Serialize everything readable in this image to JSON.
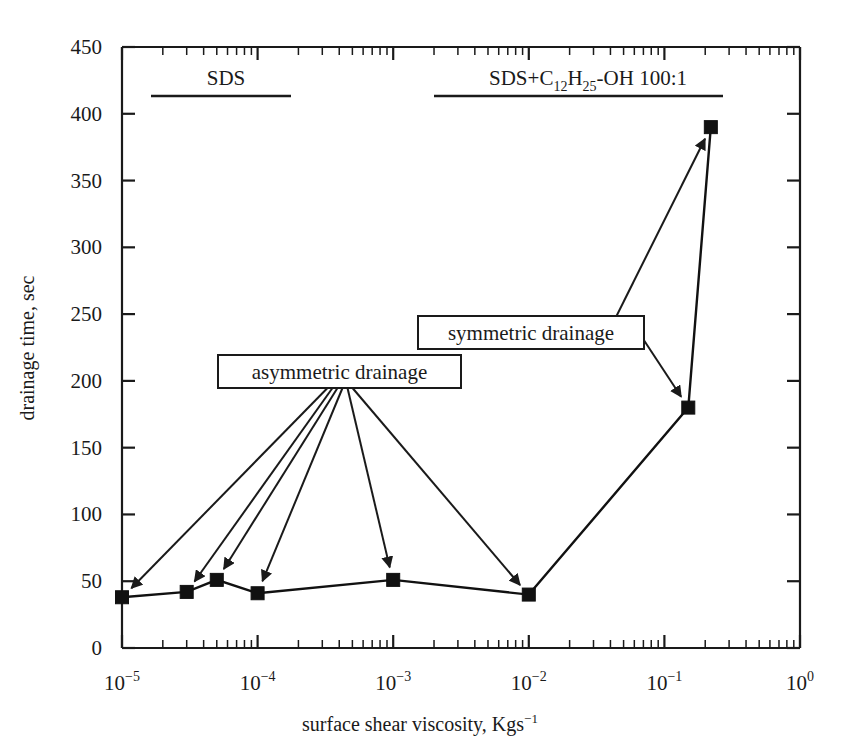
{
  "chart_data": {
    "type": "line",
    "title": "",
    "xlabel": "surface shear viscosity, Kgs−1",
    "xlabel_base": "surface shear viscosity, Kgs",
    "xlabel_exp": "−1",
    "ylabel": "drainage time, sec",
    "xscale": "log",
    "yscale": "linear",
    "xlim": [
      1e-05,
      1
    ],
    "ylim": [
      0,
      450
    ],
    "grid": false,
    "legend_position": "none",
    "x_tick_labels": [
      "10−5",
      "10−4",
      "10−3",
      "10−2",
      "10−1",
      "10⁰"
    ],
    "x_tick_values": [
      1e-05,
      0.0001,
      0.001,
      0.01,
      0.1,
      1
    ],
    "x_tick_mantissa": "10",
    "x_tick_exponents": [
      "-5",
      "-4",
      "-3",
      "-2",
      "-1",
      "0"
    ],
    "y_tick_labels": [
      "0",
      "50",
      "100",
      "150",
      "200",
      "250",
      "300",
      "350",
      "400",
      "450"
    ],
    "y_tick_values": [
      0,
      50,
      100,
      150,
      200,
      250,
      300,
      350,
      400,
      450
    ],
    "series": [
      {
        "name": "drainage time",
        "marker": "filled-square",
        "x": [
          1e-05,
          3e-05,
          5e-05,
          0.0001,
          0.001,
          0.01,
          0.15,
          0.22
        ],
        "y": [
          38,
          42,
          51,
          41,
          51,
          40,
          180,
          390
        ],
        "values": [
          38,
          42,
          51,
          41,
          51,
          40,
          180,
          390
        ]
      }
    ],
    "annotations": [
      {
        "id": "asymmetric",
        "label": "asymmetric drainage",
        "points_to": [
          {
            "x": 1e-05,
            "y": 38
          },
          {
            "x": 3e-05,
            "y": 42
          },
          {
            "x": 5e-05,
            "y": 51
          },
          {
            "x": 0.0001,
            "y": 41
          },
          {
            "x": 0.001,
            "y": 51
          },
          {
            "x": 0.01,
            "y": 40
          }
        ]
      },
      {
        "id": "symmetric",
        "label": "symmetric drainage",
        "points_to": [
          {
            "x": 0.15,
            "y": 180
          },
          {
            "x": 0.22,
            "y": 390
          }
        ]
      }
    ],
    "group_labels": [
      {
        "id": "sds",
        "label": "SDS",
        "text_plain": "SDS",
        "range_x": [
          1.5e-05,
          0.00025
        ]
      },
      {
        "id": "sds-dodecanol",
        "label": "SDS+C12H25-OH 100:1",
        "text_prefix": "SDS+C",
        "sub1": "12",
        "text_mid": "H",
        "sub2": "25",
        "text_suffix": "-OH 100:1",
        "range_x": [
          0.0015,
          0.35
        ]
      }
    ]
  },
  "axes": {
    "y_title": "drainage time, sec",
    "x_title_base": "surface shear viscosity, Kgs",
    "x_title_exp": "−1"
  },
  "labels": {
    "asymmetric_drainage": "asymmetric drainage",
    "symmetric_drainage": "symmetric drainage",
    "sds": "SDS",
    "sds_c12_prefix": "SDS+C",
    "sds_c12_sub1": "12",
    "sds_c12_mid": "H",
    "sds_c12_sub2": "25",
    "sds_c12_suffix": "-OH 100:1"
  },
  "colors": {
    "ink": "#1a1a1a",
    "marker": "#111111",
    "background": "#ffffff"
  }
}
